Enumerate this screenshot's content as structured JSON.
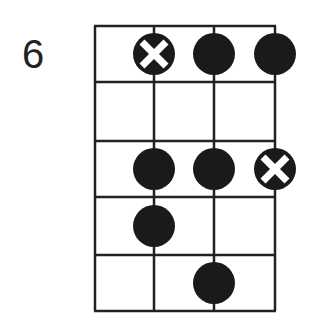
{
  "diagram": {
    "type": "fretboard-scale-diagram",
    "fret_number": "6",
    "strings": 4,
    "frets": 5,
    "line_color": "#222222",
    "dot_color": "#1a1a1a",
    "notes": [
      {
        "string": 2,
        "fret": 1,
        "type": "root"
      },
      {
        "string": 3,
        "fret": 1,
        "type": "note"
      },
      {
        "string": 4,
        "fret": 1,
        "type": "note"
      },
      {
        "string": 2,
        "fret": 3,
        "type": "note"
      },
      {
        "string": 3,
        "fret": 3,
        "type": "note"
      },
      {
        "string": 4,
        "fret": 3,
        "type": "root"
      },
      {
        "string": 2,
        "fret": 4,
        "type": "note"
      },
      {
        "string": 3,
        "fret": 5,
        "type": "note"
      }
    ]
  }
}
